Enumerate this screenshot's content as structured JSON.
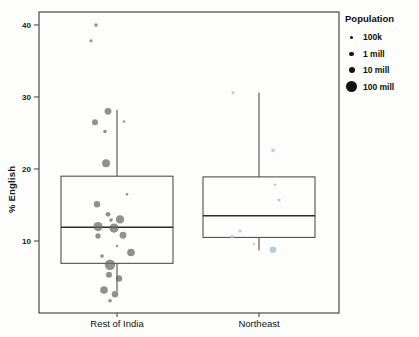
{
  "chart_data": {
    "type": "boxplot",
    "title": "",
    "xlabel": "",
    "ylabel": "% English",
    "ylim": [
      0,
      41.8
    ],
    "yticks": [
      10,
      20,
      30,
      40
    ],
    "categories": [
      "Rest of India",
      "Northeast"
    ],
    "grid": false,
    "legend": {
      "title": "Population",
      "position": "top-right",
      "items": [
        {
          "label": "100k",
          "radius_px": 1.5
        },
        {
          "label": "1 mill",
          "radius_px": 2.2
        },
        {
          "label": "10 mill",
          "radius_px": 3.0
        },
        {
          "label": "100 mill",
          "radius_px": 5.5
        }
      ]
    },
    "series": [
      {
        "name": "Rest of India",
        "color": "#6b6b6b",
        "opacity": 0.75,
        "box": {
          "whisker_low": 3.0,
          "q1": 6.9,
          "median": 11.9,
          "q3": 19.0,
          "whisker_high": 28.2
        },
        "points": [
          {
            "y": 40.0,
            "dx": -21,
            "r": 1.8
          },
          {
            "y": 37.8,
            "dx": -26,
            "r": 1.5
          },
          {
            "y": 28.0,
            "dx": -9,
            "r": 3.4
          },
          {
            "y": 26.6,
            "dx": 7,
            "r": 1.2
          },
          {
            "y": 26.5,
            "dx": -22,
            "r": 3.0
          },
          {
            "y": 25.2,
            "dx": -12,
            "r": 1.8
          },
          {
            "y": 20.8,
            "dx": -11,
            "r": 4.0
          },
          {
            "y": 16.5,
            "dx": 10,
            "r": 1.2
          },
          {
            "y": 15.1,
            "dx": -20,
            "r": 3.2
          },
          {
            "y": 13.7,
            "dx": -9,
            "r": 2.4
          },
          {
            "y": 13.0,
            "dx": 3,
            "r": 4.2
          },
          {
            "y": 12.9,
            "dx": -6,
            "r": 1.8
          },
          {
            "y": 12.0,
            "dx": -19,
            "r": 4.6
          },
          {
            "y": 11.8,
            "dx": -3,
            "r": 4.6
          },
          {
            "y": 10.8,
            "dx": 6,
            "r": 3.4
          },
          {
            "y": 10.7,
            "dx": -19,
            "r": 2.6
          },
          {
            "y": 9.3,
            "dx": 0,
            "r": 1.2
          },
          {
            "y": 8.4,
            "dx": 14,
            "r": 3.8
          },
          {
            "y": 7.9,
            "dx": -15,
            "r": 1.8
          },
          {
            "y": 6.7,
            "dx": -7,
            "r": 5.2
          },
          {
            "y": 5.3,
            "dx": -8,
            "r": 3.0
          },
          {
            "y": 4.8,
            "dx": 2,
            "r": 3.2
          },
          {
            "y": 3.2,
            "dx": -13,
            "r": 3.8
          },
          {
            "y": 2.6,
            "dx": -2,
            "r": 3.2
          },
          {
            "y": 1.7,
            "dx": -7,
            "r": 1.8
          }
        ]
      },
      {
        "name": "Northeast",
        "color": "#a9c5e2",
        "opacity": 0.9,
        "box": {
          "whisker_low": 8.7,
          "q1": 10.5,
          "median": 13.5,
          "q3": 18.9,
          "whisker_high": 30.6
        },
        "points": [
          {
            "y": 30.6,
            "dx": -26,
            "r": 1.5
          },
          {
            "y": 22.6,
            "dx": 14,
            "r": 1.8
          },
          {
            "y": 17.8,
            "dx": 16,
            "r": 1.2
          },
          {
            "y": 15.7,
            "dx": 20,
            "r": 1.5
          },
          {
            "y": 11.4,
            "dx": -19,
            "r": 1.5
          },
          {
            "y": 10.6,
            "dx": -27,
            "r": 1.8
          },
          {
            "y": 9.6,
            "dx": -5,
            "r": 1.2
          },
          {
            "y": 8.8,
            "dx": 14,
            "r": 3.2
          }
        ]
      }
    ]
  }
}
